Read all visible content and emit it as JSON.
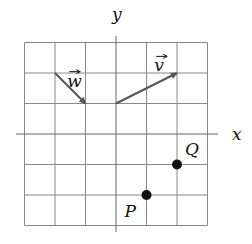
{
  "diagram": {
    "type": "coordinate-grid",
    "grid": {
      "x_min": -3,
      "x_max": 3,
      "y_min": -3,
      "y_max": 3,
      "step": 1
    },
    "axes": {
      "x_label": "x",
      "y_label": "y"
    },
    "vectors": [
      {
        "name": "w",
        "label": "w",
        "from": [
          -2,
          2
        ],
        "to": [
          -1,
          1
        ],
        "color": "#555555"
      },
      {
        "name": "v",
        "label": "v",
        "from": [
          0,
          1
        ],
        "to": [
          2,
          2
        ],
        "color": "#555555"
      }
    ],
    "points": [
      {
        "name": "Q",
        "label": "Q",
        "at": [
          2,
          -1
        ]
      },
      {
        "name": "P",
        "label": "P",
        "at": [
          1,
          -2
        ]
      }
    ],
    "colors": {
      "grid": "#888888",
      "axis": "#666666",
      "point": "#111111"
    }
  }
}
